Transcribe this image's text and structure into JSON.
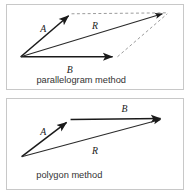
{
  "figure": {
    "background_color": "#ffffff",
    "border_color": "#c8c8c8",
    "vector_color": "#1a1a1a",
    "dashed_color": "#999999"
  },
  "panels": [
    {
      "id": "parallelogram",
      "caption": "parallelogram method",
      "vectors": [
        {
          "name": "A",
          "label": "A",
          "label_x": 40,
          "label_y": 30,
          "from": [
            18,
            57
          ],
          "to": [
            70,
            12
          ],
          "style": "solid"
        },
        {
          "name": "B",
          "label": "B",
          "label_x": 66,
          "label_y": 74,
          "from": [
            18,
            57
          ],
          "to": [
            117,
            57
          ],
          "style": "solid"
        },
        {
          "name": "R",
          "label": "R",
          "label_x": 92,
          "label_y": 28,
          "from": [
            18,
            57
          ],
          "to": [
            169,
            11
          ],
          "style": "solid"
        }
      ],
      "construction_lines": [
        {
          "name": "dashed-top",
          "from": [
            70,
            12
          ],
          "to": [
            169,
            11
          ]
        },
        {
          "name": "dashed-diagonal",
          "from": [
            117,
            57
          ],
          "to": [
            169,
            11
          ]
        }
      ]
    },
    {
      "id": "polygon",
      "caption": "polygon method",
      "vectors": [
        {
          "name": "A",
          "label": "A",
          "label_x": 42,
          "label_y": 135,
          "from": [
            20,
            158
          ],
          "to": [
            70,
            120
          ],
          "style": "solid"
        },
        {
          "name": "B",
          "label": "B",
          "label_x": 122,
          "label_y": 110,
          "from": [
            70,
            120
          ],
          "to": [
            169,
            119
          ],
          "style": "solid"
        },
        {
          "name": "R",
          "label": "R",
          "label_x": 92,
          "label_y": 155,
          "from": [
            20,
            158
          ],
          "to": [
            169,
            120
          ],
          "style": "solid"
        }
      ],
      "construction_lines": []
    }
  ]
}
